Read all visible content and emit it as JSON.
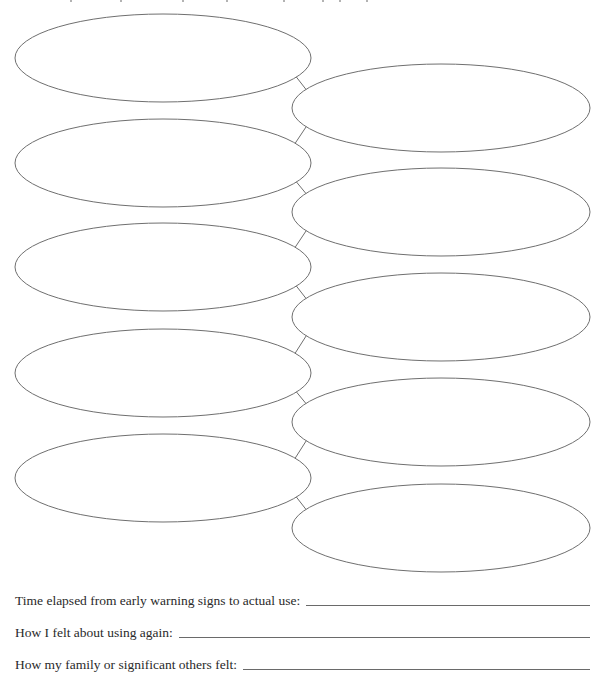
{
  "worksheet": {
    "diagram": {
      "type": "chain-of-events",
      "stroke_color": "#6f6f6f",
      "left_ovals": [
        {
          "cx": 163,
          "cy": 58,
          "rx": 148,
          "ry": 44
        },
        {
          "cx": 163,
          "cy": 163,
          "rx": 148,
          "ry": 44
        },
        {
          "cx": 163,
          "cy": 267,
          "rx": 148,
          "ry": 44
        },
        {
          "cx": 163,
          "cy": 373,
          "rx": 148,
          "ry": 44
        },
        {
          "cx": 163,
          "cy": 478,
          "rx": 148,
          "ry": 44
        }
      ],
      "right_ovals": [
        {
          "cx": 441,
          "cy": 108,
          "rx": 149,
          "ry": 44
        },
        {
          "cx": 441,
          "cy": 212,
          "rx": 149,
          "ry": 44
        },
        {
          "cx": 441,
          "cy": 317,
          "rx": 149,
          "ry": 44
        },
        {
          "cx": 441,
          "cy": 422,
          "rx": 149,
          "ry": 44
        },
        {
          "cx": 441,
          "cy": 528,
          "rx": 149,
          "ry": 44
        }
      ],
      "oval_count": 10
    },
    "prompts": [
      {
        "label": "Time elapsed from early warning signs to actual use:",
        "value": ""
      },
      {
        "label": "How I felt about using again:",
        "value": ""
      },
      {
        "label": "How my family or significant others felt:",
        "value": ""
      }
    ]
  }
}
